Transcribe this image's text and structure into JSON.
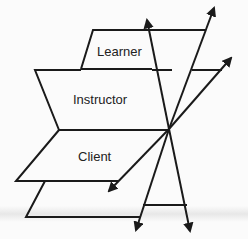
{
  "diagram": {
    "labels": {
      "learner": "Learner",
      "instructor": "Instructor",
      "client": "Client"
    },
    "colors": {
      "stroke": "#1a1a1a",
      "background": "#fbfbfb",
      "text": "#222222"
    },
    "planes": [
      {
        "name": "learner",
        "label": "Learner"
      },
      {
        "name": "instructor",
        "label": "Instructor"
      },
      {
        "name": "client",
        "label": "Client"
      },
      {
        "name": "base",
        "label": ""
      }
    ],
    "arrows": [
      {
        "direction": "up-left"
      },
      {
        "direction": "up-right"
      },
      {
        "direction": "right"
      },
      {
        "direction": "down-left"
      },
      {
        "direction": "down"
      },
      {
        "direction": "down-right"
      }
    ]
  }
}
